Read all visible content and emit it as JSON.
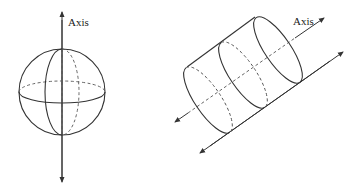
{
  "figures": {
    "sphere": {
      "axis_label": "Axis",
      "description": "Sphere with vertical axis of rotation"
    },
    "cylinder": {
      "axis_label": "Axis",
      "description": "Cylinder with diagonal axis along its length and parallel arrow"
    }
  },
  "colors": {
    "line": "#333333",
    "background": "#ffffff"
  }
}
